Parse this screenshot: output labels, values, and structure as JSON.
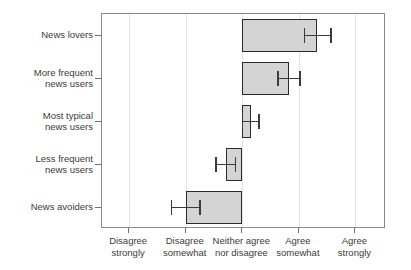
{
  "chart_data": {
    "type": "bar",
    "orientation": "horizontal",
    "title": "",
    "xlabel": "",
    "ylabel": "",
    "categories": [
      "News lovers",
      "More frequent\nnews users",
      "Most typical\nnews users",
      "Less frequent\nnews users",
      "News avoiders"
    ],
    "values": [
      4.32,
      3.82,
      3.15,
      2.72,
      2.0
    ],
    "baseline": 3.0,
    "errors_low": [
      4.1,
      3.63,
      3.0,
      2.54,
      1.75
    ],
    "errors_high": [
      4.57,
      4.02,
      3.3,
      2.88,
      2.25
    ],
    "xlim": [
      0.52,
      5.54
    ],
    "xtick_values": [
      1,
      2,
      3,
      4,
      5
    ],
    "xtick_labels": [
      "Disagree\nstrongly",
      "Disagree\nsomewhat",
      "Neither agree\nnor disagree",
      "Agree\nsomewhat",
      "Agree\nstrongly"
    ],
    "grid": true,
    "grid_axis": "x",
    "legend": null,
    "bar_fill_color": "#d4d4d4",
    "bar_edge_color": "#2b2b2b",
    "error_bar_color": "#3b3b3b",
    "grid_color": "#e4e4e4",
    "frame_color": "#8a8a8a",
    "text_color": "#3c3c3c"
  }
}
